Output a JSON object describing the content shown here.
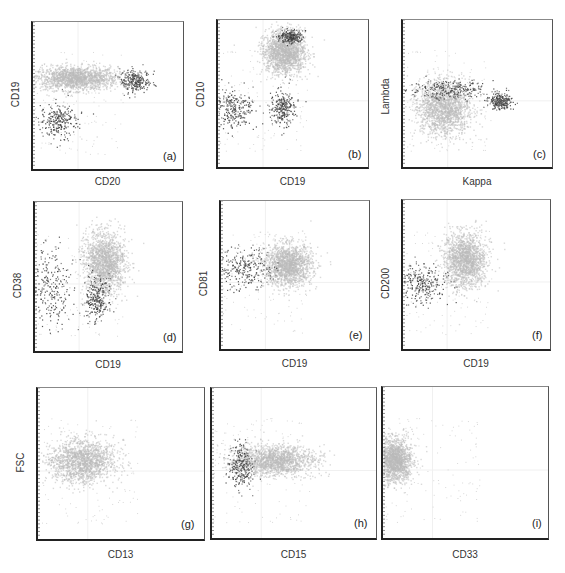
{
  "figure": {
    "colors": {
      "population_gray": "#b8b8b8",
      "population_dark": "#3a3a3a",
      "axis": "#222222"
    }
  },
  "chart_data": [
    {
      "type": "scatter",
      "panel": "(a)",
      "xlabel": "CD20",
      "ylabel": "CD19",
      "scale": "log",
      "clusters": [
        {
          "name": "main population (light gray)",
          "color": "#b8b8b8",
          "cx": 0.28,
          "cy": 0.62,
          "sx": 0.14,
          "sy": 0.04
        },
        {
          "name": "CD19+ CD20 bright (dark)",
          "color": "#3a3a3a",
          "cx": 0.68,
          "cy": 0.6,
          "sx": 0.05,
          "sy": 0.04
        },
        {
          "name": "CD19- (dark)",
          "color": "#3a3a3a",
          "cx": 0.17,
          "cy": 0.33,
          "sx": 0.06,
          "sy": 0.06
        }
      ]
    },
    {
      "type": "scatter",
      "panel": "(b)",
      "xlabel": "CD19",
      "ylabel": "CD10",
      "scale": "log",
      "clusters": [
        {
          "name": "CD10+ CD19+ (light gray)",
          "color": "#b8b8b8",
          "cx": 0.44,
          "cy": 0.78,
          "sx": 0.07,
          "sy": 0.07
        },
        {
          "name": "CD10 bright (dark)",
          "color": "#3a3a3a",
          "cx": 0.48,
          "cy": 0.89,
          "sx": 0.04,
          "sy": 0.02
        },
        {
          "name": "CD19- (dark)",
          "color": "#3a3a3a",
          "cx": 0.1,
          "cy": 0.4,
          "sx": 0.07,
          "sy": 0.07
        },
        {
          "name": "CD19+ CD10- (dark)",
          "color": "#3a3a3a",
          "cx": 0.43,
          "cy": 0.4,
          "sx": 0.04,
          "sy": 0.06
        }
      ]
    },
    {
      "type": "scatter",
      "panel": "(c)",
      "xlabel": "Kappa",
      "ylabel": "Lambda",
      "scale": "log",
      "clusters": [
        {
          "name": "main population (light gray)",
          "color": "#b8b8b8",
          "cx": 0.27,
          "cy": 0.4,
          "sx": 0.09,
          "sy": 0.09
        },
        {
          "name": "Lambda diagonal (dark)",
          "color": "#3a3a3a",
          "cx": 0.3,
          "cy": 0.53,
          "sx": 0.12,
          "sy": 0.03
        },
        {
          "name": "Kappa+ (dark)",
          "color": "#3a3a3a",
          "cx": 0.65,
          "cy": 0.45,
          "sx": 0.04,
          "sy": 0.03
        }
      ]
    },
    {
      "type": "scatter",
      "panel": "(d)",
      "xlabel": "CD19",
      "ylabel": "CD38",
      "scale": "log",
      "clusters": [
        {
          "name": "CD19+ CD38+ (light gray)",
          "color": "#b8b8b8",
          "cx": 0.47,
          "cy": 0.6,
          "sx": 0.07,
          "sy": 0.1
        },
        {
          "name": "CD19- (dark)",
          "color": "#3a3a3a",
          "cx": 0.1,
          "cy": 0.43,
          "sx": 0.08,
          "sy": 0.14
        },
        {
          "name": "CD19+ CD38 dim (dark)",
          "color": "#3a3a3a",
          "cx": 0.42,
          "cy": 0.35,
          "sx": 0.04,
          "sy": 0.08
        }
      ]
    },
    {
      "type": "scatter",
      "panel": "(e)",
      "xlabel": "CD19",
      "ylabel": "CD81",
      "scale": "log",
      "clusters": [
        {
          "name": "CD19+ CD81+ (light gray)",
          "color": "#b8b8b8",
          "cx": 0.45,
          "cy": 0.57,
          "sx": 0.08,
          "sy": 0.07
        },
        {
          "name": "CD19- (dark)",
          "color": "#3a3a3a",
          "cx": 0.15,
          "cy": 0.55,
          "sx": 0.09,
          "sy": 0.07
        }
      ]
    },
    {
      "type": "scatter",
      "panel": "(f)",
      "xlabel": "CD19",
      "ylabel": "CD200",
      "scale": "log",
      "clusters": [
        {
          "name": "CD19+ CD200+ (light gray)",
          "color": "#b8b8b8",
          "cx": 0.42,
          "cy": 0.6,
          "sx": 0.07,
          "sy": 0.09
        },
        {
          "name": "CD19- (dark)",
          "color": "#3a3a3a",
          "cx": 0.14,
          "cy": 0.44,
          "sx": 0.08,
          "sy": 0.06
        }
      ]
    },
    {
      "type": "scatter",
      "panel": "(g)",
      "xlabel": "CD13",
      "ylabel": "FSC",
      "scale": "log",
      "clusters": [
        {
          "name": "CD13- population (light gray)",
          "color": "#b8b8b8",
          "cx": 0.26,
          "cy": 0.52,
          "sx": 0.1,
          "sy": 0.07
        }
      ]
    },
    {
      "type": "scatter",
      "panel": "(h)",
      "xlabel": "CD15",
      "ylabel": "",
      "scale": "log",
      "clusters": [
        {
          "name": "CD15 population (light gray)",
          "color": "#b8b8b8",
          "cx": 0.38,
          "cy": 0.52,
          "sx": 0.12,
          "sy": 0.05
        },
        {
          "name": "CD15 dim (dark)",
          "color": "#3a3a3a",
          "cx": 0.17,
          "cy": 0.49,
          "sx": 0.04,
          "sy": 0.07
        }
      ]
    },
    {
      "type": "scatter",
      "panel": "(i)",
      "xlabel": "CD33",
      "ylabel": "",
      "scale": "log",
      "clusters": [
        {
          "name": "CD33- population (light gray)",
          "color": "#b8b8b8",
          "cx": 0.07,
          "cy": 0.52,
          "sx": 0.05,
          "sy": 0.07
        }
      ]
    }
  ],
  "panels": [
    {
      "tag": "(a)",
      "xlabel": "CD20",
      "ylabel": "CD19"
    },
    {
      "tag": "(b)",
      "xlabel": "CD19",
      "ylabel": "CD10"
    },
    {
      "tag": "(c)",
      "xlabel": "Kappa",
      "ylabel": "Lambda"
    },
    {
      "tag": "(d)",
      "xlabel": "CD19",
      "ylabel": "CD38"
    },
    {
      "tag": "(e)",
      "xlabel": "CD19",
      "ylabel": "CD81"
    },
    {
      "tag": "(f)",
      "xlabel": "CD19",
      "ylabel": "CD200"
    },
    {
      "tag": "(g)",
      "xlabel": "CD13",
      "ylabel": "FSC"
    },
    {
      "tag": "(h)",
      "xlabel": "CD15",
      "ylabel": ""
    },
    {
      "tag": "(i)",
      "xlabel": "CD33",
      "ylabel": ""
    }
  ]
}
